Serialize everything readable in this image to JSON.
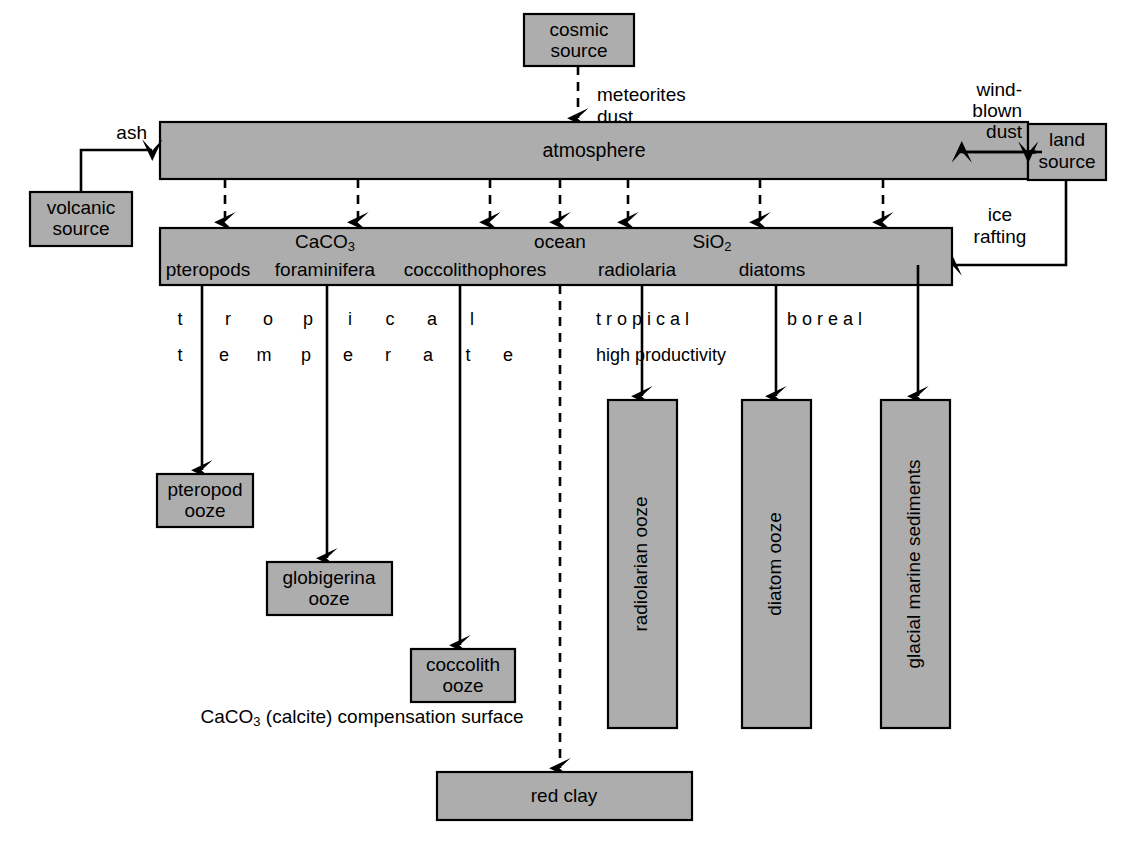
{
  "diagram": {
    "colors": {
      "box_fill": "#adadad",
      "stroke": "#000000",
      "background": "#ffffff"
    },
    "sources": {
      "cosmic": "cosmic\nsource",
      "cosmic_line1": "cosmic",
      "cosmic_line2": "source",
      "volcanic_line1": "volcanic",
      "volcanic_line2": "source",
      "land_line1": "land",
      "land_line2": "source"
    },
    "flux_labels": {
      "meteorites": "meteorites",
      "dust": "dust",
      "ash": "ash",
      "wind_blown_1": "wind-",
      "wind_blown_2": "blown",
      "wind_blown_3": "dust",
      "ice_rafting_1": "ice",
      "ice_rafting_2": "rafting"
    },
    "bands": {
      "atmosphere": "atmosphere",
      "ocean": "ocean",
      "caco3": "CaCO",
      "caco3_sub": "3",
      "sio2": "SiO",
      "sio2_sub": "2",
      "organisms": [
        "pteropods",
        "foraminifera",
        "coccolithophores",
        "radiolaria",
        "diatoms"
      ]
    },
    "zone_labels": {
      "row1_left": "t r o p i c a l",
      "row2_left": "t e m p e r a t e",
      "row1_right_a": "t r o p i c a l",
      "row1_right_b": "b o r e a l",
      "row2_right": "high productivity",
      "left_row1_chars": [
        "t",
        "r",
        "o",
        "p",
        "i",
        "c",
        "a",
        "l"
      ],
      "left_row2_chars": [
        "t",
        "e",
        "m",
        "p",
        "e",
        "r",
        "a",
        "t",
        "e"
      ]
    },
    "deposits": {
      "pteropod_1": "pteropod",
      "pteropod_2": "ooze",
      "globigerina_1": "globigerina",
      "globigerina_2": "ooze",
      "coccolith_1": "coccolith",
      "coccolith_2": "ooze",
      "radiolarian": "radiolarian ooze",
      "diatom": "diatom ooze",
      "glacial": "glacial marine sediments",
      "red_clay": "red clay"
    },
    "notes": {
      "ccd_pre": "CaCO",
      "ccd_sub": "3",
      "ccd_post": " (calcite) compensation surface"
    }
  }
}
